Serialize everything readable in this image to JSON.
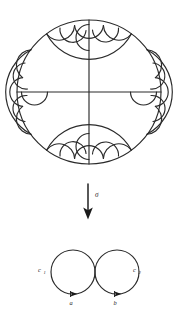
{
  "figure": {
    "stroke_color": "#2a2a2a",
    "background_color": "#ffffff"
  },
  "top_panel": {
    "name": "poincare-disk",
    "description": "Poincare disk with two perpendicular diameters and a ring of tangent geodesic semicircles along the boundary",
    "boundary_circle": {
      "cx": 89,
      "cy": 92,
      "r": 72
    },
    "diameters": [
      {
        "name": "horizontal-diameter",
        "x1": 17,
        "y1": 92,
        "x2": 161,
        "y2": 92
      },
      {
        "name": "vertical-diameter",
        "x1": 89,
        "y1": 20,
        "x2": 89,
        "y2": 164
      }
    ],
    "big_arcs": [
      {
        "name": "arc-top",
        "angle_deg": 270,
        "span_deg": 72
      },
      {
        "name": "arc-bottom",
        "angle_deg": 90,
        "span_deg": 72
      },
      {
        "name": "arc-left",
        "angle_deg": 180,
        "span_deg": 72
      },
      {
        "name": "arc-right",
        "angle_deg": 0,
        "span_deg": 72
      }
    ],
    "small_arcs_per_group": 3,
    "groups": 4
  },
  "arrow": {
    "name": "sigma-arrow",
    "label": "σ",
    "direction": "down",
    "x": 88,
    "y_start": 184,
    "y_end": 218
  },
  "bottom_panel": {
    "name": "two-tangent-circles",
    "circles": [
      {
        "name": "circle-c1",
        "label": "c",
        "subscript": "1",
        "cx": 73,
        "cy": 272,
        "r": 22
      },
      {
        "name": "circle-c2",
        "label": "c",
        "subscript": "2",
        "cx": 117,
        "cy": 272,
        "r": 22
      }
    ],
    "marked_points": [
      {
        "name": "point-a",
        "label": "a",
        "x": 73,
        "y": 294
      },
      {
        "name": "point-b",
        "label": "b",
        "x": 117,
        "y": 294
      }
    ],
    "labels": {
      "c1_x": 41,
      "c1_y": 271,
      "c2_x": 136,
      "c2_y": 271,
      "a_x": 73,
      "a_y": 303,
      "b_x": 117,
      "b_y": 303
    }
  }
}
